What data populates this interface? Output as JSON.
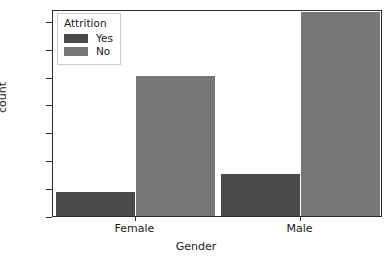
{
  "chart_data": {
    "type": "bar",
    "title": "",
    "xlabel": "Gender",
    "ylabel": "count",
    "categories": [
      "Female",
      "Male"
    ],
    "series": [
      {
        "name": "Yes",
        "values": [
          87,
          150
        ],
        "color": "#4a4a4a"
      },
      {
        "name": "No",
        "values": [
          501,
          732
        ],
        "color": "#767676"
      }
    ],
    "legend": {
      "title": "Attrition",
      "position": "upper left",
      "entries": [
        "Yes",
        "No"
      ]
    },
    "ylim": [
      0,
      742
    ],
    "yticks": [
      0,
      100,
      200,
      300,
      400,
      500,
      600,
      700
    ],
    "ytick_labels": [
      "0",
      "100",
      "200",
      "300",
      "400",
      "500",
      "600",
      "700"
    ],
    "xtick_labels": [
      "Female",
      "Male"
    ],
    "grid": false
  }
}
